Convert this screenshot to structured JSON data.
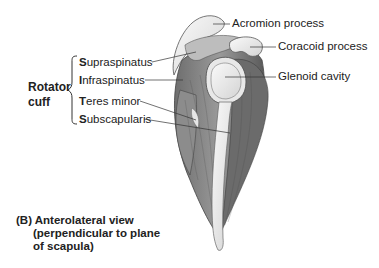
{
  "figure": {
    "view_label": "(B)",
    "caption_lines": [
      "Anterolateral view",
      "(perpendicular to plane",
      "of scapula)"
    ]
  },
  "group": {
    "title_line1": "Rotator",
    "title_line2": "cuff",
    "muscles": [
      {
        "initial": "S",
        "rest": "upraspinatus"
      },
      {
        "initial": "I",
        "rest": "nfraspinatus"
      },
      {
        "initial": "T",
        "rest": "eres minor"
      },
      {
        "initial": "S",
        "rest": "ubscapularis"
      }
    ]
  },
  "right_labels": [
    {
      "text": "Acromion process"
    },
    {
      "text": "Coracoid process"
    },
    {
      "text": "Glenoid cavity"
    }
  ],
  "colors": {
    "bone_light": "#efefef",
    "muscle_mid": "#8a8a8a",
    "muscle_dark": "#555555",
    "line": "#333333"
  }
}
